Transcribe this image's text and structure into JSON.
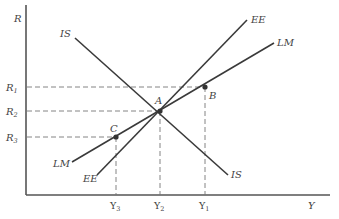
{
  "diagram": {
    "axes": {
      "y_label": "R",
      "x_label": "Y"
    },
    "curves": [
      {
        "name": "IS",
        "label_top": "IS",
        "label_bottom": "IS"
      },
      {
        "name": "LM",
        "label_top": "LM",
        "label_bottom": "LM"
      },
      {
        "name": "EE",
        "label_top": "EE",
        "label_bottom": "EE"
      }
    ],
    "points": [
      {
        "name": "A",
        "label": "A"
      },
      {
        "name": "B",
        "label": "B"
      },
      {
        "name": "C",
        "label": "C"
      }
    ],
    "y_ticks": [
      {
        "label": "R",
        "sub": "1"
      },
      {
        "label": "R",
        "sub": "2"
      },
      {
        "label": "R",
        "sub": "3"
      }
    ],
    "x_ticks": [
      {
        "label": "Y",
        "sub": "3"
      },
      {
        "label": "Y",
        "sub": "2"
      },
      {
        "label": "Y",
        "sub": "1"
      }
    ]
  }
}
